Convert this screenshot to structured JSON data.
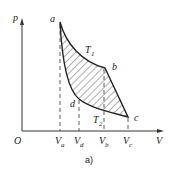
{
  "figure": {
    "caption": "a)",
    "axes": {
      "y_label": "p",
      "x_label": "V",
      "origin_label": "O"
    },
    "points": {
      "a": "a",
      "b": "b",
      "c": "c",
      "d": "d"
    },
    "isotherms": {
      "upper": "T",
      "upper_sub": "1",
      "lower": "T",
      "lower_sub": "2"
    },
    "x_ticks": [
      {
        "main": "V",
        "sub": "a"
      },
      {
        "main": "V",
        "sub": "d"
      },
      {
        "main": "V",
        "sub": "b"
      },
      {
        "main": "V",
        "sub": "c"
      }
    ]
  }
}
